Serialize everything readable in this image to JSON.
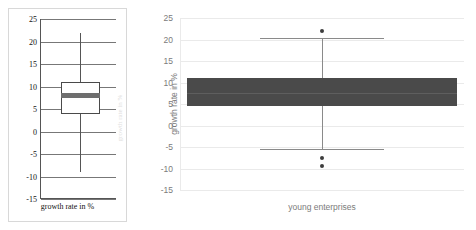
{
  "page": {
    "background": "#ffffff",
    "width": 476,
    "height": 230
  },
  "left_panel": {
    "name": "scanned-boxplot-panel",
    "x_axis_label": "growth rate in %",
    "tick_labels": [
      "25",
      "20",
      "15",
      "10",
      "5",
      "0",
      "-5",
      "-10",
      "-15"
    ],
    "border_color": "#d8d8d8",
    "axis_color": "#555555",
    "box_fill": "#ffffff",
    "median_color": "#6e6e6e"
  },
  "right_panel": {
    "name": "clean-boxplot-panel",
    "y_axis_label": "growth rate in %",
    "x_axis_label": "young enterprises",
    "tick_labels": [
      "25",
      "20",
      "15",
      "10",
      "5",
      "0",
      "-5",
      "-10",
      "-15"
    ],
    "grid_color": "#eaeaea",
    "box_fill": "#4a4a4a",
    "whisker_color": "#8a8a8a",
    "outlier_color": "#3d3d3d",
    "tick_text_color": "#7b7b7b"
  },
  "ghost_text": "growth rate in %",
  "chart_data": [
    {
      "type": "box",
      "name": "left-boxplot",
      "title": "",
      "xlabel": "growth rate in %",
      "ylabel": "",
      "ylim": [
        -15,
        25
      ],
      "yticks": [
        -15,
        -10,
        -5,
        0,
        5,
        10,
        15,
        20,
        25
      ],
      "grid": true,
      "categories": [
        "growth rate in %"
      ],
      "boxes": [
        {
          "label": "growth rate in %",
          "whisker_low": -9,
          "q1": 4,
          "median": 8,
          "q3": 11,
          "whisker_high": 22,
          "outliers": []
        }
      ]
    },
    {
      "type": "box",
      "name": "right-boxplot",
      "title": "",
      "xlabel": "young enterprises",
      "ylabel": "growth rate in %",
      "ylim": [
        -15,
        25
      ],
      "yticks": [
        -15,
        -10,
        -5,
        0,
        5,
        10,
        15,
        20,
        25
      ],
      "grid": true,
      "categories": [
        "young enterprises"
      ],
      "boxes": [
        {
          "label": "young enterprises",
          "whisker_low": -5.5,
          "q1": 4.5,
          "median": 7.5,
          "q3": 11,
          "whisker_high": 20.3,
          "outliers": [
            22,
            -7.5,
            -9.5
          ]
        }
      ]
    }
  ]
}
